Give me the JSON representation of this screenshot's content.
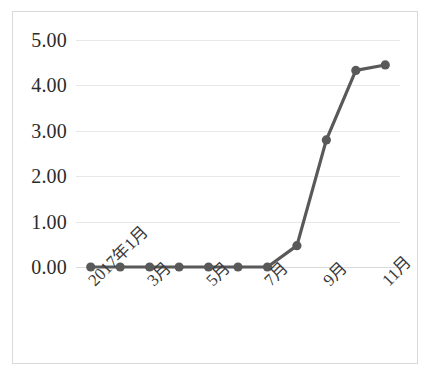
{
  "chart_data": {
    "type": "line",
    "title": "",
    "subtitle": "",
    "xlabel": "",
    "ylabel": "",
    "categories": [
      "2017年1月",
      "2月",
      "3月",
      "4月",
      "5月",
      "6月",
      "7月",
      "8月",
      "9月",
      "10月",
      "11月"
    ],
    "tick_labels_shown": [
      "2017年1月",
      "3月",
      "5月",
      "7月",
      "9月",
      "11月"
    ],
    "values": [
      0.0,
      0.0,
      0.0,
      0.0,
      0.0,
      0.0,
      0.0,
      0.47,
      2.8,
      4.33,
      4.45
    ],
    "series": [
      {
        "name": "",
        "values": [
          0.0,
          0.0,
          0.0,
          0.0,
          0.0,
          0.0,
          0.0,
          0.47,
          2.8,
          4.33,
          4.45
        ]
      }
    ],
    "ylim": [
      0,
      5
    ],
    "ytick_values": [
      0,
      1,
      2,
      3,
      4,
      5
    ],
    "ytick_labels": [
      "0.00",
      "1.00",
      "2.00",
      "3.00",
      "4.00",
      "5.00"
    ],
    "xtick_rotation": -45,
    "grid": true,
    "grid_axis": "y",
    "legend": false,
    "legend_position": "none",
    "marker": "circle",
    "line_color": "#595959",
    "marker_color": "#595959",
    "grid_color": "#e8e8e8",
    "plot_background": "#ffffff",
    "border_color": "#d9d9d9"
  }
}
